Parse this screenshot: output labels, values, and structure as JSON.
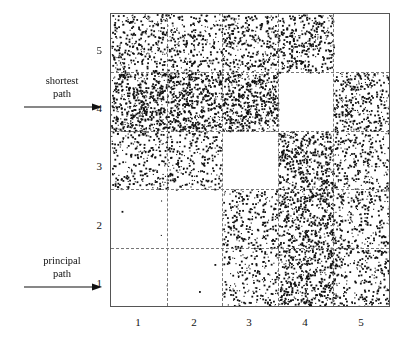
{
  "figure": {
    "title": "",
    "background_color": "#ffffff",
    "point_color": "#111111",
    "frame_color": "#555555",
    "gridline_color": "#777777"
  },
  "annotations": [
    {
      "id": "shortest-path",
      "line1": "shortest",
      "line2": "path",
      "target_tick": "4",
      "arrow_direction": "right",
      "x": 28,
      "y": 78,
      "arrow_y": 104,
      "arrow_x1": 34,
      "arrow_x2": 97
    },
    {
      "id": "principal-path",
      "line1": "principal",
      "line2": "path",
      "target_tick": "1",
      "arrow_direction": "right",
      "x": 28,
      "y": 258,
      "arrow_y": 284,
      "arrow_x1": 34,
      "arrow_x2": 97
    }
  ],
  "chart_data": {
    "type": "scatter",
    "title": "",
    "xlabel": "",
    "ylabel": "",
    "xlim": [
      0.5,
      5.5
    ],
    "ylim": [
      0.5,
      5.5
    ],
    "grid": true,
    "grid_style": "dashed",
    "xticks": [
      "1",
      "2",
      "3",
      "4",
      "5"
    ],
    "yticks": [
      "1",
      "2",
      "3",
      "4",
      "5"
    ],
    "xtick_values": [
      1,
      2,
      3,
      4,
      5
    ],
    "ytick_values": [
      1,
      2,
      3,
      4,
      5
    ],
    "cell_x_categories": [
      1,
      2,
      3,
      4,
      5
    ],
    "cell_y_categories": [
      1,
      2,
      3,
      4,
      5
    ],
    "cell_densities": [
      {
        "x": 1,
        "y": 5,
        "points": 300
      },
      {
        "x": 2,
        "y": 5,
        "points": 250
      },
      {
        "x": 3,
        "y": 5,
        "points": 330
      },
      {
        "x": 4,
        "y": 5,
        "points": 340
      },
      {
        "x": 5,
        "y": 5,
        "points": 0
      },
      {
        "x": 1,
        "y": 4,
        "points": 520
      },
      {
        "x": 2,
        "y": 4,
        "points": 520
      },
      {
        "x": 3,
        "y": 4,
        "points": 520
      },
      {
        "x": 4,
        "y": 4,
        "points": 0
      },
      {
        "x": 5,
        "y": 4,
        "points": 330
      },
      {
        "x": 1,
        "y": 3,
        "points": 230
      },
      {
        "x": 2,
        "y": 3,
        "points": 220
      },
      {
        "x": 3,
        "y": 3,
        "points": 0
      },
      {
        "x": 4,
        "y": 3,
        "points": 430
      },
      {
        "x": 5,
        "y": 3,
        "points": 230
      },
      {
        "x": 1,
        "y": 2,
        "points": 3
      },
      {
        "x": 2,
        "y": 2,
        "points": 0
      },
      {
        "x": 3,
        "y": 2,
        "points": 250
      },
      {
        "x": 4,
        "y": 2,
        "points": 430
      },
      {
        "x": 5,
        "y": 2,
        "points": 250
      },
      {
        "x": 1,
        "y": 1,
        "points": 0
      },
      {
        "x": 2,
        "y": 1,
        "points": 3
      },
      {
        "x": 3,
        "y": 1,
        "points": 190
      },
      {
        "x": 4,
        "y": 1,
        "points": 430
      },
      {
        "x": 5,
        "y": 1,
        "points": 250
      }
    ]
  }
}
